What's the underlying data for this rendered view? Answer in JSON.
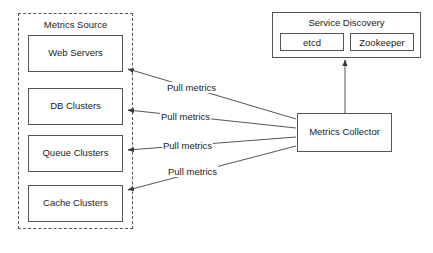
{
  "diagram": {
    "background_color": "#ffffff",
    "line_color": "#555555",
    "text_color": "#1a1a1a"
  },
  "metrics_source_group": {
    "title": "Metrics Source",
    "border_style": "dashed",
    "nodes": [
      {
        "label": "Web Servers",
        "x": 28,
        "y": 35,
        "w": 95,
        "h": 37
      },
      {
        "label": "DB Clusters",
        "x": 28,
        "y": 88,
        "w": 95,
        "h": 37
      },
      {
        "label": "Queue Clusters",
        "x": 28,
        "y": 135,
        "w": 95,
        "h": 37
      },
      {
        "label": "Cache Clusters",
        "x": 28,
        "y": 185,
        "w": 95,
        "h": 37
      }
    ]
  },
  "service_discovery": {
    "title": "Service Discovery",
    "children": [
      {
        "label": "etcd"
      },
      {
        "label": "Zookeeper"
      }
    ]
  },
  "metrics_collector": {
    "label": "Metrics Collector"
  },
  "edges": {
    "pull_labels": [
      {
        "text": "Pull metrics",
        "x": 166,
        "y": 82
      },
      {
        "text": "Pull metrics",
        "x": 160,
        "y": 111
      },
      {
        "text": "Pull metrics",
        "x": 162,
        "y": 140
      },
      {
        "text": "Pull metrics",
        "x": 167,
        "y": 166
      }
    ],
    "registry_edge": {
      "from": "Metrics Collector",
      "to": "Service Discovery",
      "label": ""
    }
  }
}
